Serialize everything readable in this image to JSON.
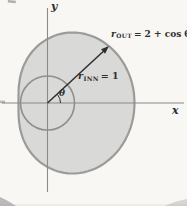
{
  "figure": {
    "type": "polar-region-diagram",
    "axes": {
      "x_label": "x",
      "y_label": "y"
    },
    "angle_label": "θ",
    "outer_label": {
      "base": "r",
      "sub": "OUT",
      "rest": "= 2 + cos θ"
    },
    "inner_label": {
      "base": "r",
      "sub": "INN",
      "rest": "= 1"
    },
    "curves": {
      "outer": {
        "formula": "r = 2 + cos θ",
        "a": 2,
        "b": 1
      },
      "inner": {
        "formula": "r = 1",
        "radius": 1
      }
    },
    "arrow_angle_deg": 40,
    "colors": {
      "fill": "#d9d9d8",
      "outline": "#9b9b9a",
      "inner_stroke": "#8f8f8e",
      "axis": "#8a8a89",
      "ink": "#2e2e2e",
      "paper": "#f8f7f4"
    }
  }
}
